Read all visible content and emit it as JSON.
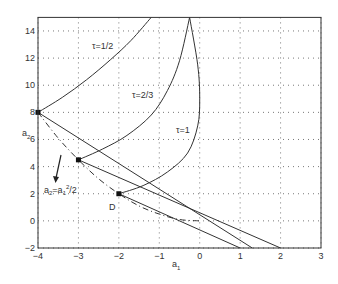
{
  "chart_data": {
    "type": "line",
    "title": "",
    "xlabel": "a1",
    "ylabel": "a2",
    "xlim": [
      -4,
      3
    ],
    "ylim": [
      -2,
      15
    ],
    "grid": true,
    "xticks": [
      "-4",
      "-3",
      "-2",
      "-1",
      "0",
      "1",
      "2",
      "3"
    ],
    "yticks": [
      "-2",
      "0",
      "2",
      "4",
      "6",
      "8",
      "10",
      "12",
      "14"
    ],
    "series": [
      {
        "name": "τ=1/2",
        "style": "solid",
        "points": [
          [
            -4,
            8
          ],
          [
            -3.4,
            9.1
          ],
          [
            -2.8,
            10.4
          ],
          [
            -2.2,
            11.9
          ],
          [
            -1.7,
            13.3
          ],
          [
            -1.2,
            15
          ]
        ]
      },
      {
        "name": "τ=2/3",
        "style": "solid",
        "points": [
          [
            -3,
            4.5
          ],
          [
            -2.4,
            5.3
          ],
          [
            -1.8,
            6.3
          ],
          [
            -1.2,
            7.8
          ],
          [
            -0.8,
            9.6
          ],
          [
            -0.5,
            11.8
          ],
          [
            -0.25,
            15
          ]
        ]
      },
      {
        "name": "τ=1",
        "style": "solid",
        "points": [
          [
            -2,
            2
          ],
          [
            -1.4,
            2.6
          ],
          [
            -0.8,
            3.6
          ],
          [
            -0.3,
            5
          ],
          [
            -0.05,
            7
          ],
          [
            0,
            9
          ],
          [
            -0.05,
            11.5
          ],
          [
            -0.25,
            15
          ]
        ]
      },
      {
        "name": "line from (-4,8)",
        "style": "solid",
        "points": [
          [
            -4,
            8
          ],
          [
            1.3,
            -2
          ]
        ]
      },
      {
        "name": "line from (-3,4.5)",
        "style": "solid",
        "points": [
          [
            -3,
            4.5
          ],
          [
            2,
            -2
          ]
        ]
      },
      {
        "name": "line from (-2,2)",
        "style": "solid",
        "points": [
          [
            -2,
            2
          ],
          [
            1,
            -2
          ]
        ]
      },
      {
        "name": "a2=a1^2/2",
        "style": "dashdot",
        "points": [
          [
            -4,
            8
          ],
          [
            -3.5,
            6.1
          ],
          [
            -3,
            4.5
          ],
          [
            -2.5,
            3.1
          ],
          [
            -2,
            2
          ],
          [
            -1.5,
            1.1
          ],
          [
            -1,
            0.5
          ],
          [
            -0.5,
            0.1
          ],
          [
            0,
            0
          ]
        ]
      }
    ],
    "markers": [
      [
        -4,
        8
      ],
      [
        -3,
        4.5
      ],
      [
        -2,
        2
      ]
    ],
    "annotations": [
      {
        "text": "τ=1/2",
        "at": [
          -2.6,
          12.9
        ]
      },
      {
        "text": "τ=2/3",
        "at": [
          -0.9,
          8.6
        ]
      },
      {
        "text": "τ=1",
        "at": [
          -0.5,
          5.3
        ]
      },
      {
        "text": "D",
        "at": [
          -2.1,
          1.1
        ]
      },
      {
        "text": "a2=a1^2/2",
        "at": [
          -3.6,
          2.2
        ],
        "arrow_from": [
          -3.4,
          5.5
        ],
        "arrow_to": [
          -3.5,
          3.0
        ]
      }
    ]
  },
  "labels": {
    "xlabel_main": "a",
    "xlabel_sub": "1",
    "ylabel_main": "a",
    "ylabel_sub": "2",
    "tau_half": "τ=1/2",
    "tau_two_thirds": "τ=2/3",
    "tau_one": "τ=1",
    "point_d": "D",
    "parabola_a": "a",
    "parabola_sub2": "2",
    "parabola_eq": "=a",
    "parabola_sub1": "1",
    "parabola_sup": "2",
    "parabola_tail": "/2"
  }
}
